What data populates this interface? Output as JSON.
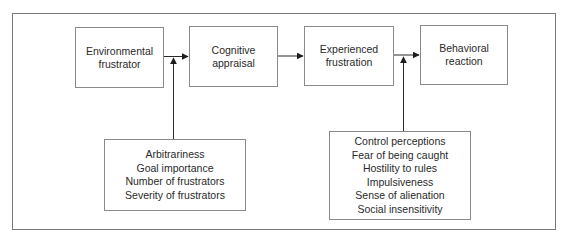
{
  "diagram": {
    "type": "flowchart",
    "direction": "left-to-right",
    "stages": [
      {
        "id": "environmental-frustrator",
        "lines": [
          "Environmental",
          "frustrator"
        ]
      },
      {
        "id": "cognitive-appraisal",
        "lines": [
          "Cognitive",
          "appraisal"
        ]
      },
      {
        "id": "experienced-frustration",
        "lines": [
          "Experienced",
          "frustration"
        ]
      },
      {
        "id": "behavioral-reaction",
        "lines": [
          "Behavioral",
          "reaction"
        ]
      }
    ],
    "moderators": [
      {
        "id": "appraisal-moderators",
        "points_to": "arrow between Environmental frustrator and Cognitive appraisal",
        "items": [
          "Arbitrariness",
          "Goal importance",
          "Number of frustrators",
          "Severity of frustrators"
        ]
      },
      {
        "id": "reaction-moderators",
        "points_to": "arrow between Experienced frustration and Behavioral reaction",
        "items": [
          "Control perceptions",
          "Fear of being caught",
          "Hostility to rules",
          "Impulsiveness",
          "Sense of alienation",
          "Social insensitivity"
        ]
      }
    ],
    "edges": [
      {
        "from": "environmental-frustrator",
        "to": "cognitive-appraisal"
      },
      {
        "from": "cognitive-appraisal",
        "to": "experienced-frustration"
      },
      {
        "from": "experienced-frustration",
        "to": "behavioral-reaction"
      },
      {
        "from": "appraisal-moderators",
        "to": "edge:environmental-frustrator->cognitive-appraisal"
      },
      {
        "from": "reaction-moderators",
        "to": "edge:experienced-frustration->behavioral-reaction"
      }
    ],
    "colors": {
      "line": "#2a2a2a",
      "box_border": "#8a8a8a",
      "frame_border": "#7a7a7a",
      "text": "#2a2a2a",
      "background": "#ffffff"
    }
  }
}
